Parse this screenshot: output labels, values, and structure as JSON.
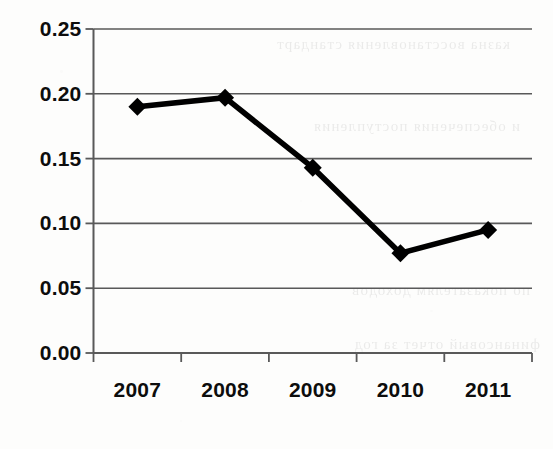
{
  "chart_data": {
    "type": "line",
    "title": "",
    "subtitle": "",
    "xlabel": "",
    "ylabel": "",
    "categories": [
      "2007",
      "2008",
      "2009",
      "2010",
      "2011"
    ],
    "values": [
      0.19,
      0.197,
      0.143,
      0.077,
      0.095
    ],
    "series": [
      {
        "name": "",
        "values": [
          0.19,
          0.197,
          0.143,
          0.077,
          0.095
        ]
      }
    ],
    "ylim": [
      0.0,
      0.25
    ],
    "ytick_labels": [
      "0.00",
      "0.05",
      "0.10",
      "0.15",
      "0.20",
      "0.25"
    ],
    "ytick_values": [
      0.0,
      0.05,
      0.1,
      0.15,
      0.2,
      0.25
    ],
    "xtick_labels": [
      "2007",
      "2008",
      "2009",
      "2010",
      "2011"
    ],
    "grid": "horizontal",
    "legend": "none",
    "annotations": [],
    "marker": "diamond",
    "line_color": "#000000",
    "marker_color": "#000000",
    "grid_color": "#595959",
    "axis_color": "#595959",
    "background_color": "#fdfdfc"
  },
  "artifacts": {
    "bleed_text": [
      "казна восстановления стандарт",
      "и обеспечения поступления",
      "по показателям доходов",
      "финансовый отчет за год"
    ]
  }
}
